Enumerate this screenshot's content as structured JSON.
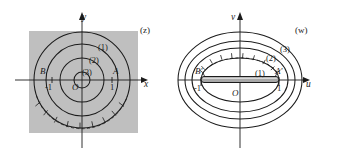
{
  "figure": {
    "width": 340,
    "height": 162,
    "background": "#ffffff",
    "stroke_color": "#1b1b1b",
    "shaded_region_color": "#bfbfbf",
    "slit_fill_color": "#a8a8a8"
  },
  "panels": [
    {
      "id": "z-plane",
      "plane_label": "(z)",
      "axes": {
        "horizontal_label": "x",
        "vertical_label": "y",
        "origin_label": "O"
      },
      "points": [
        {
          "name": "A",
          "label": "A",
          "tick_label": "1",
          "x": 1,
          "y": 0
        },
        {
          "name": "B",
          "label": "B",
          "tick_label": "-1",
          "x": -1,
          "y": 0
        }
      ],
      "curves": [
        {
          "label": "(1)",
          "kind": "circle",
          "radius": 1.9
        },
        {
          "label": "(2)",
          "kind": "circle",
          "radius": 1.45
        },
        {
          "label": "(3)",
          "kind": "circle",
          "radius": 0.9
        }
      ],
      "shaded_region": {
        "shape": "square",
        "description": "gray square background"
      },
      "hatched_curve": {
        "description": "cross-hatched arc on lower part of circle (1)"
      }
    },
    {
      "id": "w-plane",
      "plane_label": "(w)",
      "axes": {
        "horizontal_label": "u",
        "vertical_label": "v",
        "origin_label": "O"
      },
      "points": [
        {
          "name": "A-prime",
          "label": "A'",
          "tick_label": "1",
          "u": 1,
          "v": 0
        },
        {
          "name": "B-prime",
          "label": "B'",
          "tick_label": "-1",
          "u": -1,
          "v": 0
        }
      ],
      "curves": [
        {
          "label": "(1)",
          "kind": "ellipse",
          "semi_major": 1.18,
          "semi_minor": 0.62
        },
        {
          "label": "(2)",
          "kind": "ellipse",
          "semi_major": 1.52,
          "semi_minor": 1.05
        },
        {
          "label": "(3)",
          "kind": "ellipse",
          "semi_major": 1.92,
          "semi_minor": 1.48
        }
      ],
      "slit": {
        "description": "horizontal slit segment from -1 to 1 on the u-axis"
      },
      "hatched_curve": {
        "description": "cross-hatched arc on upper part of ellipse (1)"
      }
    }
  ]
}
